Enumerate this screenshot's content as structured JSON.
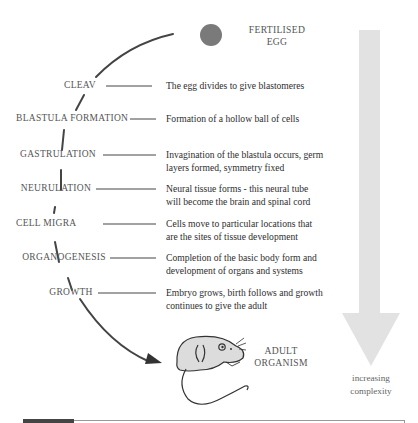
{
  "diagram": {
    "start": {
      "label_line1": "FERTILISED",
      "label_line2": "EGG",
      "color": "#7a7a7a"
    },
    "end": {
      "label_line1": "ADULT",
      "label_line2": "ORGANISM"
    },
    "stages": [
      {
        "name": "CLEAV",
        "desc_line1": "The egg divides to give blastomeres",
        "desc_line2": ""
      },
      {
        "name": "BLASTULA FORMATION",
        "desc_line1": "Formation of a hollow ball of cells",
        "desc_line2": ""
      },
      {
        "name": "GASTRULATION",
        "desc_line1": "Invagination of the blastula occurs, germ",
        "desc_line2": "layers formed, symmetry fixed"
      },
      {
        "name": "NEURULATION",
        "desc_line1": "Neural tissue forms - this neural tube",
        "desc_line2": "will become the brain and spinal cord"
      },
      {
        "name": "CELL MIGRA",
        "desc_line1": "Cells move to particular locations that",
        "desc_line2": "are the sites of tissue development"
      },
      {
        "name": "ORGANOGENESIS",
        "desc_line1": "Completion of the basic body form and",
        "desc_line2": "development of organs and systems"
      },
      {
        "name": "GROWTH",
        "desc_line1": "Embryo grows, birth follows and growth",
        "desc_line2": "continues to give the adult"
      }
    ],
    "complexity_arrow": {
      "label_line1": "increasing",
      "label_line2": "complexity",
      "color": "#e2e2e2"
    },
    "arc_color": "#444444",
    "mouse_fill": "#dcdcdc"
  }
}
